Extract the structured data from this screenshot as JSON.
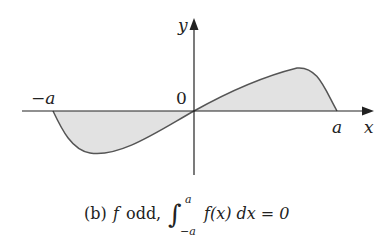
{
  "figure": {
    "axes": {
      "x_label": "x",
      "y_label": "y",
      "origin_label": "0",
      "neg_a_label": "−a",
      "pos_a_label": "a"
    },
    "curve": {
      "description": "odd function f on [-a, a], shaded area between curve and x-axis",
      "fill_color": "#e2e2e2",
      "stroke_color": "#555555"
    },
    "caption": {
      "part": "(b)",
      "func": "f",
      "text": "odd,",
      "integral_upper": "a",
      "integral_lower": "−a",
      "integrand": "f(x) dx = 0"
    }
  }
}
